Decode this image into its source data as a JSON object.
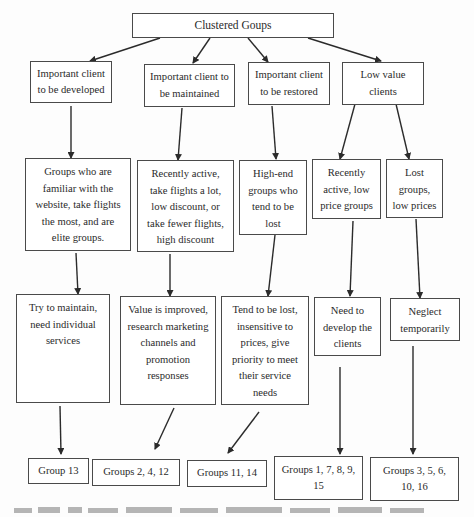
{
  "root": {
    "label": "Clustered Goups"
  },
  "categories": [
    {
      "label": "Important client\nto be developed"
    },
    {
      "label": "Important client to\nbe maintained"
    },
    {
      "label": "Important client\nto be restored"
    },
    {
      "label": "Low value\nclients"
    }
  ],
  "descriptions": [
    {
      "label": "Groups who are\nfamiliar with the\nwebsite, take flights\nthe most, and are\nelite groups."
    },
    {
      "label": "Recently active,\ntake flights a lot,\nlow discount, or\ntake fewer flights,\nhigh discount"
    },
    {
      "label": "High-end\ngroups who\ntend to be\nlost"
    },
    {
      "label": "Recently\nactive, low\nprice groups"
    },
    {
      "label": "Lost\ngroups,\nlow prices"
    }
  ],
  "strategies": [
    {
      "label": "Try to maintain,\nneed individual\nservices"
    },
    {
      "label": "Value is improved,\nresearch marketing\nchannels and\npromotion\nresponses"
    },
    {
      "label": "Tend to be lost,\ninsensitive to\nprices, give\npriority to meet\ntheir service\nneeds"
    },
    {
      "label": "Need to\ndevelop the\nclients"
    },
    {
      "label": "Neglect\ntemporarily"
    }
  ],
  "groups": [
    {
      "label": "Group 13"
    },
    {
      "label": "Groups 2, 4, 12"
    },
    {
      "label": "Groups 11, 14"
    },
    {
      "label": "Groups 1, 7, 8, 9,\n15"
    },
    {
      "label": "Groups 3, 5, 6,\n10, 16"
    }
  ],
  "colors": {
    "line": "#2b2b2b",
    "border": "#4a4a4a",
    "text": "#2a2a2a"
  }
}
